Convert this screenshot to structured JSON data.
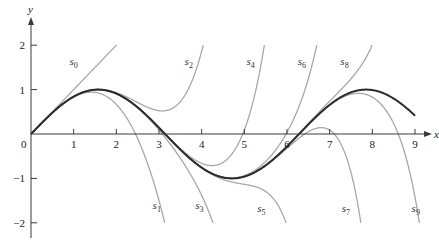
{
  "chart_data": {
    "type": "line",
    "title": "",
    "xlabel": "x",
    "ylabel": "y",
    "xlim": [
      0,
      9.3
    ],
    "ylim": [
      -2.3,
      2.5
    ],
    "xticks": [
      1,
      2,
      3,
      4,
      5,
      6,
      7,
      8,
      9
    ],
    "yticks": [
      -2,
      -1,
      1,
      2
    ],
    "origin_label": "0",
    "grid": false,
    "legend": "none",
    "function": {
      "name": "sin x",
      "style": "dark-thick"
    },
    "series": [
      {
        "name": "s0",
        "label_main": "s",
        "label_sub": "0",
        "order": 0,
        "label_at": [
          0.9,
          1.55
        ]
      },
      {
        "name": "s1",
        "label_main": "s",
        "label_sub": "1",
        "order": 1,
        "label_at": [
          2.85,
          -1.7
        ]
      },
      {
        "name": "s2",
        "label_main": "s",
        "label_sub": "2",
        "order": 2,
        "label_at": [
          3.6,
          1.55
        ]
      },
      {
        "name": "s3",
        "label_main": "s",
        "label_sub": "3",
        "order": 3,
        "label_at": [
          3.85,
          -1.7
        ]
      },
      {
        "name": "s4",
        "label_main": "s",
        "label_sub": "4",
        "order": 4,
        "label_at": [
          5.05,
          1.55
        ]
      },
      {
        "name": "s5",
        "label_main": "s",
        "label_sub": "5",
        "order": 5,
        "label_at": [
          5.3,
          -1.75
        ]
      },
      {
        "name": "s6",
        "label_main": "s",
        "label_sub": "6",
        "order": 6,
        "label_at": [
          6.25,
          1.55
        ]
      },
      {
        "name": "s7",
        "label_main": "s",
        "label_sub": "7",
        "order": 7,
        "label_at": [
          7.28,
          -1.75
        ]
      },
      {
        "name": "s8",
        "label_main": "s",
        "label_sub": "8",
        "order": 8,
        "label_at": [
          7.25,
          1.55
        ]
      },
      {
        "name": "s9",
        "label_main": "s",
        "label_sub": "9",
        "order": 9,
        "label_at": [
          8.92,
          -1.75
        ]
      }
    ],
    "annotation": "s_n = partial sums of the Taylor series of sin x: sum_{k=0}^{n} (-1)^k x^(2k+1)/(2k+1)!",
    "curve_clip_y": [
      -2,
      2
    ],
    "main_x_range": [
      0,
      9
    ]
  }
}
